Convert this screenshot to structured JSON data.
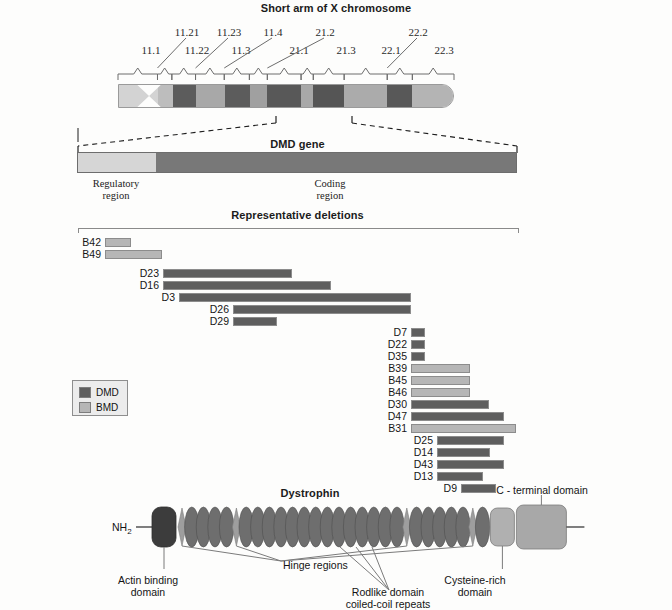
{
  "figure": {
    "chromosome_title": "Short arm of X chromosome",
    "gene_title": "DMD gene",
    "deletions_title": "Representative deletions",
    "protein_title": "Dystrophin"
  },
  "chromosome": {
    "band_labels": [
      {
        "text": "11.1",
        "x": 150,
        "y": 44
      },
      {
        "text": "11.22",
        "x": 196,
        "y": 44
      },
      {
        "text": "11.3",
        "x": 240,
        "y": 44
      },
      {
        "text": "21.1",
        "x": 298,
        "y": 44
      },
      {
        "text": "21.3",
        "x": 345,
        "y": 44
      },
      {
        "text": "22.1",
        "x": 390,
        "y": 44
      },
      {
        "text": "22.3",
        "x": 443,
        "y": 44
      },
      {
        "text": "11.21",
        "x": 186,
        "y": 26
      },
      {
        "text": "11.23",
        "x": 228,
        "y": 26
      },
      {
        "text": "11.4",
        "x": 272,
        "y": 26
      },
      {
        "text": "21.2",
        "x": 324,
        "y": 26
      },
      {
        "text": "22.2",
        "x": 417,
        "y": 26
      }
    ],
    "bands": [
      {
        "name": "11.1",
        "start": 0,
        "end": 55,
        "color": "#d3d3d3"
      },
      {
        "name": "11.22",
        "start": 55,
        "end": 75,
        "color": "#bdbdbd"
      },
      {
        "name": "11.23",
        "start": 75,
        "end": 108,
        "color": "#5c5c5c"
      },
      {
        "name": "11.3",
        "start": 108,
        "end": 148,
        "color": "#a8a8a8"
      },
      {
        "name": "11.4",
        "start": 148,
        "end": 183,
        "color": "#5c5c5c"
      },
      {
        "name": "21.1",
        "start": 183,
        "end": 208,
        "color": "#a0a0a0"
      },
      {
        "name": "21.2",
        "start": 208,
        "end": 255,
        "color": "#585858"
      },
      {
        "name": "21.3",
        "start": 255,
        "end": 272,
        "color": "#a8a8a8"
      },
      {
        "name": "22.1",
        "start": 272,
        "end": 315,
        "color": "#555555"
      },
      {
        "name": "22.2",
        "start": 315,
        "end": 375,
        "color": "#ababab"
      },
      {
        "name": "22.3a",
        "start": 375,
        "end": 410,
        "color": "#585858"
      },
      {
        "name": "22.3b",
        "start": 410,
        "end": 468,
        "color": "#b4b4b4"
      }
    ]
  },
  "gene": {
    "regions": [
      {
        "label_line1": "Regulatory",
        "label_line2": "region",
        "color": "#d6d6d6",
        "start": 0,
        "end": 78
      },
      {
        "label_line1": "Coding",
        "label_line2": "region",
        "color": "#787878",
        "start": 78,
        "end": 440
      }
    ]
  },
  "deletions": {
    "rows": [
      {
        "id": "B42",
        "type": "BMD",
        "start": 105,
        "end": 131,
        "y": 238
      },
      {
        "id": "B49",
        "type": "BMD",
        "start": 105,
        "end": 162,
        "y": 250
      },
      {
        "id": "D23",
        "type": "DMD",
        "start": 163,
        "end": 292,
        "y": 269
      },
      {
        "id": "D16",
        "type": "DMD",
        "start": 163,
        "end": 331,
        "y": 281
      },
      {
        "id": "D3",
        "type": "DMD",
        "start": 179,
        "end": 411,
        "y": 293
      },
      {
        "id": "D26",
        "type": "DMD",
        "start": 233,
        "end": 411,
        "y": 305
      },
      {
        "id": "D29",
        "type": "DMD",
        "start": 233,
        "end": 277,
        "y": 317
      },
      {
        "id": "D7",
        "type": "DMD",
        "start": 411,
        "end": 425,
        "y": 328
      },
      {
        "id": "D22",
        "type": "DMD",
        "start": 411,
        "end": 425,
        "y": 340
      },
      {
        "id": "D35",
        "type": "DMD",
        "start": 411,
        "end": 425,
        "y": 352
      },
      {
        "id": "B39",
        "type": "BMD",
        "start": 411,
        "end": 470,
        "y": 364
      },
      {
        "id": "B45",
        "type": "BMD",
        "start": 411,
        "end": 470,
        "y": 376
      },
      {
        "id": "B46",
        "type": "BMD",
        "start": 411,
        "end": 470,
        "y": 388
      },
      {
        "id": "D30",
        "type": "DMD",
        "start": 411,
        "end": 489,
        "y": 400
      },
      {
        "id": "D47",
        "type": "DMD",
        "start": 411,
        "end": 504,
        "y": 412
      },
      {
        "id": "B31",
        "type": "BMD",
        "start": 411,
        "end": 516,
        "y": 424
      },
      {
        "id": "D25",
        "type": "DMD",
        "start": 437,
        "end": 504,
        "y": 436
      },
      {
        "id": "D14",
        "type": "DMD",
        "start": 437,
        "end": 490,
        "y": 448
      },
      {
        "id": "D43",
        "type": "DMD",
        "start": 437,
        "end": 504,
        "y": 460
      },
      {
        "id": "D13",
        "type": "DMD",
        "start": 437,
        "end": 483,
        "y": 472
      },
      {
        "id": "D9",
        "type": "DMD",
        "start": 461,
        "end": 496,
        "y": 484
      }
    ],
    "legend": [
      {
        "label": "DMD",
        "color": "#5e5e5e"
      },
      {
        "label": "BMD",
        "color": "#b6b6b6"
      }
    ],
    "colors": {
      "DMD": "#5e5e5e",
      "BMD": "#b6b6b6"
    }
  },
  "protein": {
    "n_terminus": "NH",
    "n_terminus_sub": "2",
    "c_terminus": "COOH",
    "annotations": [
      {
        "id": "actin-binding-domain",
        "line1": "Actin binding",
        "line2": "domain"
      },
      {
        "id": "hinge-regions",
        "line1": "Hinge regions",
        "line2": ""
      },
      {
        "id": "rodlike-domain",
        "line1": "Rodlike domain",
        "line2": "coiled-coil repeats"
      },
      {
        "id": "cysteine-rich-domain",
        "line1": "Cysteine-rich",
        "line2": "domain"
      },
      {
        "id": "c-terminal-domain",
        "line1": "C - terminal domain",
        "line2": ""
      }
    ],
    "repeat_count": 24,
    "hinge_positions": [
      0,
      4,
      18,
      23
    ],
    "colors": {
      "actin": "#3c3c3c",
      "repeat": "#6e6e6e",
      "hinge": "#9e9e9e",
      "cysteine": "#b0b0b0",
      "cterm": "#a8a8a8"
    }
  }
}
